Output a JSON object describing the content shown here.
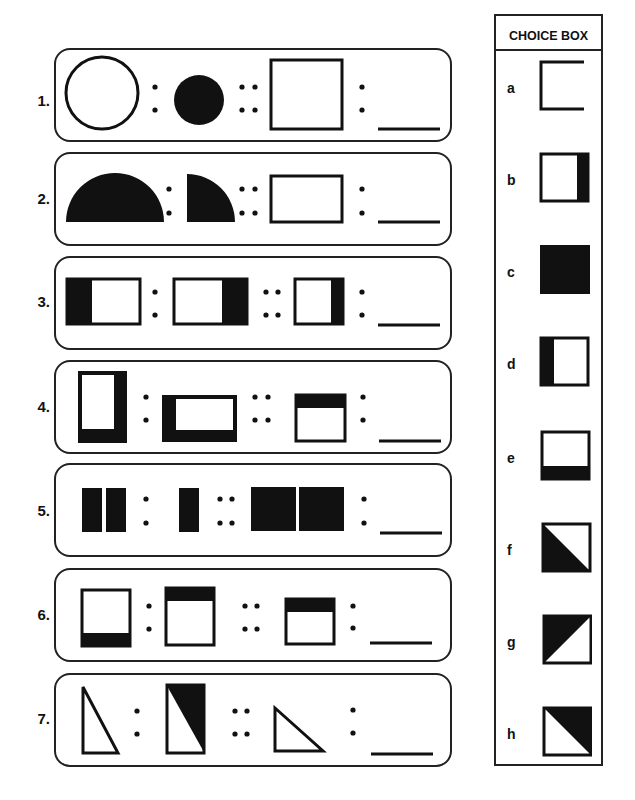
{
  "worksheet": {
    "questions": [
      {
        "number": "1.",
        "shapes": [
          "outline-circle-large",
          "filled-circle-small",
          "outline-square-large"
        ],
        "answer": ""
      },
      {
        "number": "2.",
        "shapes": [
          "filled-semicircle",
          "filled-quarter-circle",
          "outline-rectangle"
        ],
        "answer": ""
      },
      {
        "number": "3.",
        "shapes": [
          "rect-left-black",
          "rect-right-black",
          "tall-rect-right-black"
        ],
        "answer": ""
      },
      {
        "number": "4.",
        "shapes": [
          "tall-rect-right-bottom-black",
          "wide-rect-left-bottom-black",
          "square-top-black"
        ],
        "answer": ""
      },
      {
        "number": "5.",
        "shapes": [
          "two-small-black-bars",
          "one-small-black-bar",
          "two-large-black-squares"
        ],
        "answer": ""
      },
      {
        "number": "6.",
        "shapes": [
          "square-bottom-black",
          "square-top-black",
          "small-square-top-black"
        ],
        "answer": ""
      },
      {
        "number": "7.",
        "shapes": [
          "outline-right-triangle-tall",
          "rect-with-black-triangle",
          "outline-right-triangle-short"
        ],
        "answer": ""
      }
    ],
    "separators": {
      "ratio": ":",
      "proportion": "::"
    }
  },
  "choice_box": {
    "title": "CHOICE BOX",
    "options": [
      {
        "label": "a",
        "shape": "outline-square"
      },
      {
        "label": "b",
        "shape": "square-right-black"
      },
      {
        "label": "c",
        "shape": "solid-black-square"
      },
      {
        "label": "d",
        "shape": "square-left-black"
      },
      {
        "label": "e",
        "shape": "square-bottom-black"
      },
      {
        "label": "f",
        "shape": "square-lower-left-triangle-black"
      },
      {
        "label": "g",
        "shape": "square-upper-left-triangle-black"
      },
      {
        "label": "h",
        "shape": "square-upper-right-triangle-black"
      }
    ]
  }
}
